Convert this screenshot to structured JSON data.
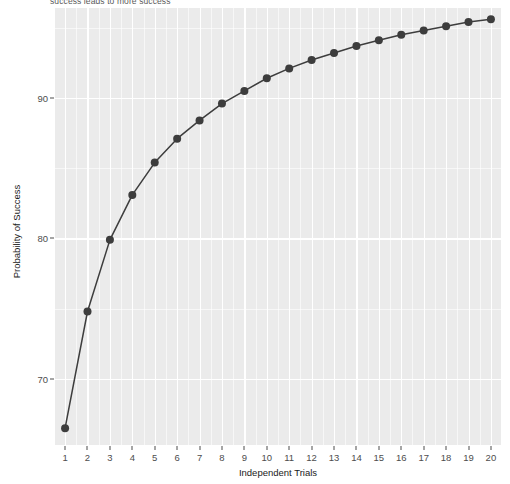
{
  "chart_data": {
    "type": "line",
    "title": "",
    "subtitle": "success leads to more success",
    "xlabel": "Independent Trials",
    "ylabel": "Probability of Success",
    "x": [
      1,
      2,
      3,
      4,
      5,
      6,
      7,
      8,
      9,
      10,
      11,
      12,
      13,
      14,
      15,
      16,
      17,
      18,
      19,
      20
    ],
    "values": [
      66.5,
      74.8,
      79.9,
      83.1,
      85.4,
      87.1,
      88.4,
      89.6,
      90.5,
      91.4,
      92.1,
      92.7,
      93.2,
      93.7,
      94.1,
      94.5,
      94.8,
      95.1,
      95.4,
      95.6
    ],
    "series": [
      {
        "name": "Probability of Success",
        "values": [
          66.5,
          74.8,
          79.9,
          83.1,
          85.4,
          87.1,
          88.4,
          89.6,
          90.5,
          91.4,
          92.1,
          92.7,
          93.2,
          93.7,
          94.1,
          94.5,
          94.8,
          95.1,
          95.4,
          95.6
        ]
      }
    ],
    "x_tick_labels": [
      "1",
      "2",
      "3",
      "4",
      "5",
      "6",
      "7",
      "8",
      "9",
      "10",
      "11",
      "12",
      "13",
      "14",
      "15",
      "16",
      "17",
      "18",
      "19",
      "20"
    ],
    "y_tick_labels": [
      "70",
      "80",
      "90"
    ],
    "y_ticks": [
      70,
      80,
      90
    ],
    "xlim": [
      0.55,
      20.45
    ],
    "ylim": [
      65.3,
      96.4
    ],
    "grid": true,
    "legend": "none",
    "marker": "filled-circle",
    "line_color": "#3d3d3d",
    "point_color": "#3d3d3d",
    "panel_color": "#ebebeb",
    "grid_color": "#ffffff",
    "background_color": "#ffffff"
  }
}
